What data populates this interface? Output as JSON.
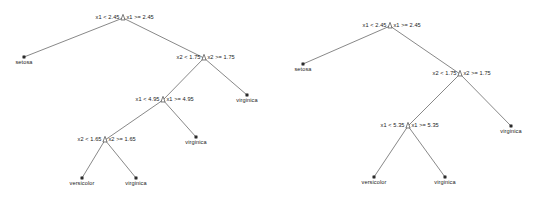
{
  "figure": {
    "type": "decision-tree-diagram",
    "panel_count": 2,
    "background_color": "#ffffff",
    "edge_color": "#555555",
    "split_marker_color": "#ffffff",
    "leaf_marker_color": "#2b2b2b",
    "text_color": "#1a1a1a"
  },
  "trees": [
    {
      "id": "left-tree",
      "name": "left-decision-tree",
      "splits": [
        {
          "id": "l-split-root",
          "name": "split-x1-2.45",
          "left_label": "x1 < 2.45",
          "right_label": "x1 >= 2.45",
          "x": 123,
          "y": 18
        },
        {
          "id": "l-split-x2-175",
          "name": "split-x2-1.75",
          "left_label": "x2 < 1.75",
          "right_label": "x2 >= 1.75",
          "x": 204,
          "y": 58
        },
        {
          "id": "l-split-x1-495",
          "name": "split-x1-4.95",
          "left_label": "x1 < 4.95",
          "right_label": "x1 >= 4.95",
          "x": 163,
          "y": 100
        },
        {
          "id": "l-split-x2-165",
          "name": "split-x2-1.65",
          "left_label": "x2 < 1.65",
          "right_label": "x2 >= 1.65",
          "x": 105,
          "y": 140
        }
      ],
      "leaves": [
        {
          "id": "l-leaf-setosa",
          "name": "leaf-setosa",
          "label": "setosa",
          "x": 24,
          "y": 57
        },
        {
          "id": "l-leaf-virginica-a",
          "name": "leaf-virginica",
          "label": "virginica",
          "x": 247,
          "y": 95
        },
        {
          "id": "l-leaf-virginica-b",
          "name": "leaf-virginica",
          "label": "virginica",
          "x": 196,
          "y": 137
        },
        {
          "id": "l-leaf-versicolor",
          "name": "leaf-versicolor",
          "label": "versicolor",
          "x": 82,
          "y": 178
        },
        {
          "id": "l-leaf-virginica-c",
          "name": "leaf-virginica",
          "label": "virginica",
          "x": 136,
          "y": 178
        }
      ],
      "edges": [
        {
          "from": "l-split-root",
          "to": "l-leaf-setosa"
        },
        {
          "from": "l-split-root",
          "to": "l-split-x2-175"
        },
        {
          "from": "l-split-x2-175",
          "to": "l-split-x1-495"
        },
        {
          "from": "l-split-x2-175",
          "to": "l-leaf-virginica-a"
        },
        {
          "from": "l-split-x1-495",
          "to": "l-split-x2-165"
        },
        {
          "from": "l-split-x1-495",
          "to": "l-leaf-virginica-b"
        },
        {
          "from": "l-split-x2-165",
          "to": "l-leaf-versicolor"
        },
        {
          "from": "l-split-x2-165",
          "to": "l-leaf-virginica-c"
        }
      ]
    },
    {
      "id": "right-tree",
      "name": "right-decision-tree",
      "splits": [
        {
          "id": "r-split-root",
          "name": "split-x1-2.45",
          "left_label": "x1 < 2.45",
          "right_label": "x1 >= 2.45",
          "x": 390,
          "y": 26
        },
        {
          "id": "r-split-x2-175",
          "name": "split-x2-1.75",
          "left_label": "x2 < 1.75",
          "right_label": "x2 >= 1.75",
          "x": 460,
          "y": 74
        },
        {
          "id": "r-split-x1-535",
          "name": "split-x1-5.35",
          "left_label": "x1 < 5.35",
          "right_label": "x1 >= 5.35",
          "x": 408,
          "y": 126
        }
      ],
      "leaves": [
        {
          "id": "r-leaf-setosa",
          "name": "leaf-setosa",
          "label": "setosa",
          "x": 303,
          "y": 64
        },
        {
          "id": "r-leaf-virginica-a",
          "name": "leaf-virginica",
          "label": "virginica",
          "x": 511,
          "y": 126
        },
        {
          "id": "r-leaf-versicolor",
          "name": "leaf-versicolor",
          "label": "versicolor",
          "x": 374,
          "y": 177
        },
        {
          "id": "r-leaf-virginica-b",
          "name": "leaf-virginica",
          "label": "virginica",
          "x": 445,
          "y": 177
        }
      ],
      "edges": [
        {
          "from": "r-split-root",
          "to": "r-leaf-setosa"
        },
        {
          "from": "r-split-root",
          "to": "r-split-x2-175"
        },
        {
          "from": "r-split-x2-175",
          "to": "r-split-x1-535"
        },
        {
          "from": "r-split-x2-175",
          "to": "r-leaf-virginica-a"
        },
        {
          "from": "r-split-x1-535",
          "to": "r-leaf-versicolor"
        },
        {
          "from": "r-split-x1-535",
          "to": "r-leaf-virginica-b"
        }
      ]
    }
  ]
}
